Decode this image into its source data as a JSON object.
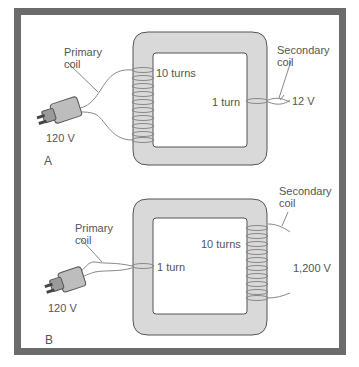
{
  "colors": {
    "frame": "#6b6b6b",
    "core_fill": "#d9d9d9",
    "core_stroke": "#555555",
    "wire": "#888888",
    "text": "#555555"
  },
  "panels": [
    {
      "letter": "A",
      "primary_label_line1": "Primary",
      "primary_label_line2": "coil",
      "primary_turns": "10 turns",
      "input_voltage": "120 V",
      "secondary_label_line1": "Secondary",
      "secondary_label_line2": "coil",
      "secondary_turns": "1 turn",
      "output_voltage": "12 V"
    },
    {
      "letter": "B",
      "primary_label_line1": "Primary",
      "primary_label_line2": "coil",
      "primary_turns": "1 turn",
      "input_voltage": "120 V",
      "secondary_label_line1": "Secondary",
      "secondary_label_line2": "coil",
      "secondary_turns": "10 turns",
      "output_voltage": "1,200 V"
    }
  ]
}
